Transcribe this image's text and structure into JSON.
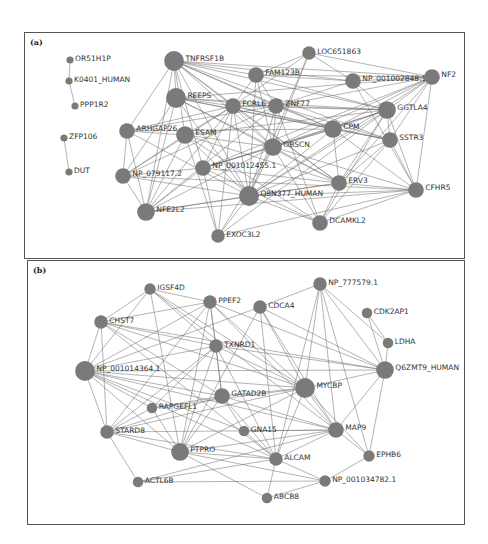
{
  "panels": [
    {
      "id": "a",
      "label": "(a)",
      "nodes": [
        {
          "name": "OR51H1P",
          "size": 1,
          "x": 70,
          "y": 60
        },
        {
          "name": "K0401_HUMAN",
          "size": 1,
          "x": 69,
          "y": 81
        },
        {
          "name": "PPP1R2",
          "size": 1,
          "x": 75,
          "y": 106
        },
        {
          "name": "ZFP106",
          "size": 1,
          "x": 64,
          "y": 138
        },
        {
          "name": "DUT",
          "size": 1,
          "x": 69,
          "y": 172
        },
        {
          "name": "TNFRSF1B",
          "size": 4,
          "x": 174,
          "y": 61
        },
        {
          "name": "REEPS",
          "size": 4,
          "x": 176,
          "y": 98
        },
        {
          "name": "ARHGAP26",
          "size": 3,
          "x": 127,
          "y": 131
        },
        {
          "name": "ESAM",
          "size": 3.5,
          "x": 185,
          "y": 135
        },
        {
          "name": "NP_079117.2",
          "size": 3,
          "x": 123,
          "y": 176
        },
        {
          "name": "NFE2L2",
          "size": 3.5,
          "x": 146,
          "y": 212
        },
        {
          "name": "EXOC3L2",
          "size": 2.5,
          "x": 218,
          "y": 236
        },
        {
          "name": "NP_001012455.1",
          "size": 3,
          "x": 203,
          "y": 168
        },
        {
          "name": "FAM123B",
          "size": 3,
          "x": 256,
          "y": 75
        },
        {
          "name": "FCRL6",
          "size": 3,
          "x": 233,
          "y": 106
        },
        {
          "name": "ZNF77",
          "size": 3,
          "x": 276,
          "y": 106
        },
        {
          "name": "OBSCN",
          "size": 3.5,
          "x": 273,
          "y": 147
        },
        {
          "name": "Q8N377_HUMAN",
          "size": 4,
          "x": 249,
          "y": 196
        },
        {
          "name": "LOC651863",
          "size": 2.5,
          "x": 309,
          "y": 53
        },
        {
          "name": "NP_001002848.1",
          "size": 3,
          "x": 353,
          "y": 81
        },
        {
          "name": "NF2",
          "size": 3,
          "x": 432,
          "y": 77
        },
        {
          "name": "CPM",
          "size": 3.5,
          "x": 333,
          "y": 129
        },
        {
          "name": "GGTLA4",
          "size": 3.5,
          "x": 387,
          "y": 110
        },
        {
          "name": "SSTR3",
          "size": 3,
          "x": 390,
          "y": 140
        },
        {
          "name": "ERV3",
          "size": 3,
          "x": 339,
          "y": 183
        },
        {
          "name": "CFHR5",
          "size": 3,
          "x": 416,
          "y": 190
        },
        {
          "name": "DCAMKL2",
          "size": 3,
          "x": 320,
          "y": 223
        }
      ],
      "edges": [
        [
          "OR51H1P",
          "K0401_HUMAN"
        ],
        [
          "K0401_HUMAN",
          "PPP1R2"
        ],
        [
          "ZFP106",
          "DUT"
        ],
        [
          "TNFRSF1B",
          "REEPS"
        ],
        [
          "TNFRSF1B",
          "FAM123B"
        ],
        [
          "TNFRSF1B",
          "FCRL6"
        ],
        [
          "TNFRSF1B",
          "ZNF77"
        ],
        [
          "TNFRSF1B",
          "OBSCN"
        ],
        [
          "TNFRSF1B",
          "CPM"
        ],
        [
          "TNFRSF1B",
          "GGTLA4"
        ],
        [
          "TNFRSF1B",
          "SSTR3"
        ],
        [
          "TNFRSF1B",
          "NP_001002848.1"
        ],
        [
          "TNFRSF1B",
          "Q8N377_HUMAN"
        ],
        [
          "TNFRSF1B",
          "ESAM"
        ],
        [
          "TNFRSF1B",
          "ARHGAP26"
        ],
        [
          "TNFRSF1B",
          "NP_001012455.1"
        ],
        [
          "TNFRSF1B",
          "ERV3"
        ],
        [
          "TNFRSF1B",
          "NF2"
        ],
        [
          "TNFRSF1B",
          "NFE2L2"
        ],
        [
          "REEPS",
          "FCRL6"
        ],
        [
          "REEPS",
          "ZNF77"
        ],
        [
          "REEPS",
          "CPM"
        ],
        [
          "REEPS",
          "GGTLA4"
        ],
        [
          "REEPS",
          "SSTR3"
        ],
        [
          "REEPS",
          "OBSCN"
        ],
        [
          "REEPS",
          "Q8N377_HUMAN"
        ],
        [
          "REEPS",
          "NP_079117.2"
        ],
        [
          "REEPS",
          "NFE2L2"
        ],
        [
          "REEPS",
          "ERV3"
        ],
        [
          "REEPS",
          "NF2"
        ],
        [
          "ARHGAP26",
          "ESAM"
        ],
        [
          "ARHGAP26",
          "NP_079117.2"
        ],
        [
          "ARHGAP26",
          "NFE2L2"
        ],
        [
          "ARHGAP26",
          "FCRL6"
        ],
        [
          "ARHGAP26",
          "ZNF77"
        ],
        [
          "ARHGAP26",
          "Q8N377_HUMAN"
        ],
        [
          "ARHGAP26",
          "CPM"
        ],
        [
          "ESAM",
          "FCRL6"
        ],
        [
          "ESAM",
          "OBSCN"
        ],
        [
          "ESAM",
          "Q8N377_HUMAN"
        ],
        [
          "ESAM",
          "NP_079117.2"
        ],
        [
          "ESAM",
          "NFE2L2"
        ],
        [
          "ESAM",
          "GGTLA4"
        ],
        [
          "ESAM",
          "EXOC3L2"
        ],
        [
          "ESAM",
          "ERV3"
        ],
        [
          "ESAM",
          "DCAMKL2"
        ],
        [
          "NP_079117.2",
          "NP_001012455.1"
        ],
        [
          "NP_079117.2",
          "Q8N377_HUMAN"
        ],
        [
          "NP_079117.2",
          "FCRL6"
        ],
        [
          "NP_079117.2",
          "ZNF77"
        ],
        [
          "NP_079117.2",
          "CFHR5"
        ],
        [
          "NP_079117.2",
          "NFE2L2"
        ],
        [
          "NFE2L2",
          "NP_001012455.1"
        ],
        [
          "NFE2L2",
          "Q8N377_HUMAN"
        ],
        [
          "NFE2L2",
          "ERV3"
        ],
        [
          "NFE2L2",
          "CFHR5"
        ],
        [
          "NFE2L2",
          "FCRL6"
        ],
        [
          "NFE2L2",
          "OBSCN"
        ],
        [
          "NFE2L2",
          "ZNF77"
        ],
        [
          "EXOC3L2",
          "NP_001012455.1"
        ],
        [
          "EXOC3L2",
          "Q8N377_HUMAN"
        ],
        [
          "EXOC3L2",
          "OBSCN"
        ],
        [
          "EXOC3L2",
          "FCRL6"
        ],
        [
          "EXOC3L2",
          "CFHR5"
        ],
        [
          "EXOC3L2",
          "GGTLA4"
        ],
        [
          "NP_001012455.1",
          "ERV3"
        ],
        [
          "NP_001012455.1",
          "OBSCN"
        ],
        [
          "NP_001012455.1",
          "GGTLA4"
        ],
        [
          "NP_001012455.1",
          "CPM"
        ],
        [
          "NP_001012455.1",
          "DCAMKL2"
        ],
        [
          "NP_001012455.1",
          "NF2"
        ],
        [
          "NP_001012455.1",
          "FCRL6"
        ],
        [
          "FAM123B",
          "FCRL6"
        ],
        [
          "FAM123B",
          "ZNF77"
        ],
        [
          "FAM123B",
          "NP_001002848.1"
        ],
        [
          "FAM123B",
          "OBSCN"
        ],
        [
          "FAM123B",
          "Q8N377_HUMAN"
        ],
        [
          "FAM123B",
          "NF2"
        ],
        [
          "FAM123B",
          "GGTLA4"
        ],
        [
          "FCRL6",
          "ZNF77"
        ],
        [
          "FCRL6",
          "OBSCN"
        ],
        [
          "FCRL6",
          "Q8N377_HUMAN"
        ],
        [
          "FCRL6",
          "CPM"
        ],
        [
          "FCRL6",
          "GGTLA4"
        ],
        [
          "FCRL6",
          "SSTR3"
        ],
        [
          "FCRL6",
          "ERV3"
        ],
        [
          "ZNF77",
          "OBSCN"
        ],
        [
          "ZNF77",
          "CPM"
        ],
        [
          "ZNF77",
          "GGTLA4"
        ],
        [
          "ZNF77",
          "NF2"
        ],
        [
          "ZNF77",
          "Q8N377_HUMAN"
        ],
        [
          "ZNF77",
          "SSTR3"
        ],
        [
          "ZNF77",
          "DCAMKL2"
        ],
        [
          "OBSCN",
          "CPM"
        ],
        [
          "OBSCN",
          "GGTLA4"
        ],
        [
          "OBSCN",
          "Q8N377_HUMAN"
        ],
        [
          "OBSCN",
          "ERV3"
        ],
        [
          "OBSCN",
          "CFHR5"
        ],
        [
          "OBSCN",
          "DCAMKL2"
        ],
        [
          "OBSCN",
          "NF2"
        ],
        [
          "Q8N377_HUMAN",
          "ERV3"
        ],
        [
          "Q8N377_HUMAN",
          "CFHR5"
        ],
        [
          "Q8N377_HUMAN",
          "DCAMKL2"
        ],
        [
          "Q8N377_HUMAN",
          "CPM"
        ],
        [
          "Q8N377_HUMAN",
          "GGTLA4"
        ],
        [
          "Q8N377_HUMAN",
          "SSTR3"
        ],
        [
          "Q8N377_HUMAN",
          "NF2"
        ],
        [
          "LOC651863",
          "NP_001002848.1"
        ],
        [
          "LOC651863",
          "NF2"
        ],
        [
          "LOC651863",
          "FAM123B"
        ],
        [
          "LOC651863",
          "OBSCN"
        ],
        [
          "LOC651863",
          "Q8N377_HUMAN"
        ],
        [
          "LOC651863",
          "FCRL6"
        ],
        [
          "NP_001002848.1",
          "NF2"
        ],
        [
          "NP_001002848.1",
          "GGTLA4"
        ],
        [
          "NP_001002848.1",
          "ZNF77"
        ],
        [
          "NP_001002848.1",
          "CFHR5"
        ],
        [
          "NF2",
          "GGTLA4"
        ],
        [
          "NF2",
          "CPM"
        ],
        [
          "NF2",
          "SSTR3"
        ],
        [
          "NF2",
          "CFHR5"
        ],
        [
          "NF2",
          "ERV3"
        ],
        [
          "CPM",
          "GGTLA4"
        ],
        [
          "CPM",
          "SSTR3"
        ],
        [
          "CPM",
          "ERV3"
        ],
        [
          "CPM",
          "CFHR5"
        ],
        [
          "GGTLA4",
          "SSTR3"
        ],
        [
          "GGTLA4",
          "ERV3"
        ],
        [
          "GGTLA4",
          "DCAMKL2"
        ],
        [
          "GGTLA4",
          "CFHR5"
        ],
        [
          "SSTR3",
          "CFHR5"
        ],
        [
          "SSTR3",
          "ERV3"
        ],
        [
          "SSTR3",
          "DCAMKL2"
        ],
        [
          "ERV3",
          "CFHR5"
        ],
        [
          "ERV3",
          "DCAMKL2"
        ],
        [
          "CFHR5",
          "DCAMKL2"
        ]
      ]
    },
    {
      "id": "b",
      "label": "(b)",
      "nodes": [
        {
          "name": "IGSF4D",
          "size": 2,
          "x": 150,
          "y": 289
        },
        {
          "name": "PPEF2",
          "size": 2.5,
          "x": 210,
          "y": 302
        },
        {
          "name": "CHST7",
          "size": 2.5,
          "x": 101,
          "y": 322
        },
        {
          "name": "CDCA4",
          "size": 2.5,
          "x": 260,
          "y": 307
        },
        {
          "name": "NP_777579.1",
          "size": 2.5,
          "x": 320,
          "y": 284
        },
        {
          "name": "CDK2AP1",
          "size": 1.8,
          "x": 367,
          "y": 313
        },
        {
          "name": "LDHA",
          "size": 1.8,
          "x": 388,
          "y": 343
        },
        {
          "name": "TXNRD1",
          "size": 2.5,
          "x": 216,
          "y": 346
        },
        {
          "name": "NP_001014364.1",
          "size": 4,
          "x": 85,
          "y": 371
        },
        {
          "name": "Q6ZMT9_HUMAN",
          "size": 3.5,
          "x": 385,
          "y": 370
        },
        {
          "name": "MYCBP",
          "size": 4,
          "x": 305,
          "y": 388
        },
        {
          "name": "GATAD2B",
          "size": 3,
          "x": 222,
          "y": 396
        },
        {
          "name": "RAPGEFL1",
          "size": 1.8,
          "x": 152,
          "y": 408
        },
        {
          "name": "STARD8",
          "size": 2.5,
          "x": 107,
          "y": 432
        },
        {
          "name": "GNA15",
          "size": 1.8,
          "x": 244,
          "y": 431
        },
        {
          "name": "MAP9",
          "size": 3,
          "x": 336,
          "y": 430
        },
        {
          "name": "PTPRO",
          "size": 3.5,
          "x": 180,
          "y": 452
        },
        {
          "name": "ALCAM",
          "size": 2.5,
          "x": 276,
          "y": 459
        },
        {
          "name": "EPHB6",
          "size": 2,
          "x": 369,
          "y": 456
        },
        {
          "name": "ACTL6B",
          "size": 1.8,
          "x": 138,
          "y": 482
        },
        {
          "name": "NP_001034782.1",
          "size": 2,
          "x": 325,
          "y": 481
        },
        {
          "name": "ABCB8",
          "size": 1.8,
          "x": 267,
          "y": 498
        }
      ],
      "edges": [
        [
          "IGSF4D",
          "PPEF2"
        ],
        [
          "IGSF4D",
          "CHST7"
        ],
        [
          "IGSF4D",
          "TXNRD1"
        ],
        [
          "IGSF4D",
          "MYCBP"
        ],
        [
          "IGSF4D",
          "PTPRO"
        ],
        [
          "IGSF4D",
          "MAP9"
        ],
        [
          "IGSF4D",
          "NP_001014364.1"
        ],
        [
          "PPEF2",
          "CHST7"
        ],
        [
          "PPEF2",
          "TXNRD1"
        ],
        [
          "PPEF2",
          "NP_001014364.1"
        ],
        [
          "PPEF2",
          "MYCBP"
        ],
        [
          "PPEF2",
          "PTPRO"
        ],
        [
          "PPEF2",
          "STARD8"
        ],
        [
          "PPEF2",
          "Q6ZMT9_HUMAN"
        ],
        [
          "PPEF2",
          "GATAD2B"
        ],
        [
          "PPEF2",
          "MAP9"
        ],
        [
          "CHST7",
          "NP_001014364.1"
        ],
        [
          "CHST7",
          "TXNRD1"
        ],
        [
          "CHST7",
          "MYCBP"
        ],
        [
          "CHST7",
          "GATAD2B"
        ],
        [
          "CHST7",
          "STARD8"
        ],
        [
          "CHST7",
          "ALCAM"
        ],
        [
          "CHST7",
          "Q6ZMT9_HUMAN"
        ],
        [
          "CDCA4",
          "NP_777579.1"
        ],
        [
          "CDCA4",
          "MYCBP"
        ],
        [
          "CDCA4",
          "MAP9"
        ],
        [
          "CDCA4",
          "Q6ZMT9_HUMAN"
        ],
        [
          "CDCA4",
          "NP_001014364.1"
        ],
        [
          "CDCA4",
          "ALCAM"
        ],
        [
          "CDCA4",
          "PTPRO"
        ],
        [
          "NP_777579.1",
          "MYCBP"
        ],
        [
          "NP_777579.1",
          "MAP9"
        ],
        [
          "NP_777579.1",
          "Q6ZMT9_HUMAN"
        ],
        [
          "NP_777579.1",
          "LDHA"
        ],
        [
          "NP_777579.1",
          "EPHB6"
        ],
        [
          "NP_777579.1",
          "ALCAM"
        ],
        [
          "CDK2AP1",
          "LDHA"
        ],
        [
          "CDK2AP1",
          "Q6ZMT9_HUMAN"
        ],
        [
          "LDHA",
          "Q6ZMT9_HUMAN"
        ],
        [
          "TXNRD1",
          "NP_001014364.1"
        ],
        [
          "TXNRD1",
          "GATAD2B"
        ],
        [
          "TXNRD1",
          "MYCBP"
        ],
        [
          "TXNRD1",
          "PTPRO"
        ],
        [
          "TXNRD1",
          "STARD8"
        ],
        [
          "TXNRD1",
          "Q6ZMT9_HUMAN"
        ],
        [
          "TXNRD1",
          "RAPGEFL1"
        ],
        [
          "TXNRD1",
          "ALCAM"
        ],
        [
          "NP_001014364.1",
          "MYCBP"
        ],
        [
          "NP_001014364.1",
          "GATAD2B"
        ],
        [
          "NP_001014364.1",
          "STARD8"
        ],
        [
          "NP_001014364.1",
          "PTPRO"
        ],
        [
          "NP_001014364.1",
          "MAP9"
        ],
        [
          "NP_001014364.1",
          "Q6ZMT9_HUMAN"
        ],
        [
          "NP_001014364.1",
          "ALCAM"
        ],
        [
          "NP_001014364.1",
          "RAPGEFL1"
        ],
        [
          "NP_001014364.1",
          "GNA15"
        ],
        [
          "Q6ZMT9_HUMAN",
          "MYCBP"
        ],
        [
          "Q6ZMT9_HUMAN",
          "EPHB6"
        ],
        [
          "Q6ZMT9_HUMAN",
          "MAP9"
        ],
        [
          "MYCBP",
          "GATAD2B"
        ],
        [
          "MYCBP",
          "MAP9"
        ],
        [
          "MYCBP",
          "PTPRO"
        ],
        [
          "MYCBP",
          "ALCAM"
        ],
        [
          "MYCBP",
          "EPHB6"
        ],
        [
          "MYCBP",
          "STARD8"
        ],
        [
          "MYCBP",
          "RAPGEFL1"
        ],
        [
          "GATAD2B",
          "PTPRO"
        ],
        [
          "GATAD2B",
          "STARD8"
        ],
        [
          "GATAD2B",
          "MAP9"
        ],
        [
          "GATAD2B",
          "GNA15"
        ],
        [
          "GATAD2B",
          "RAPGEFL1"
        ],
        [
          "GATAD2B",
          "ALCAM"
        ],
        [
          "RAPGEFL1",
          "PTPRO"
        ],
        [
          "RAPGEFL1",
          "STARD8"
        ],
        [
          "STARD8",
          "PTPRO"
        ],
        [
          "STARD8",
          "ACTL6B"
        ],
        [
          "STARD8",
          "MAP9"
        ],
        [
          "STARD8",
          "ALCAM"
        ],
        [
          "GNA15",
          "MAP9"
        ],
        [
          "GNA15",
          "ALCAM"
        ],
        [
          "MAP9",
          "PTPRO"
        ],
        [
          "MAP9",
          "EPHB6"
        ],
        [
          "MAP9",
          "ALCAM"
        ],
        [
          "PTPRO",
          "ALCAM"
        ],
        [
          "PTPRO",
          "ABCB8"
        ],
        [
          "PTPRO",
          "NP_001034782.1"
        ],
        [
          "ALCAM",
          "NP_001034782.1"
        ],
        [
          "ALCAM",
          "ABCB8"
        ],
        [
          "EPHB6",
          "NP_001034782.1"
        ],
        [
          "ACTL6B",
          "MAP9"
        ],
        [
          "ACTL6B",
          "ALCAM"
        ],
        [
          "ACTL6B",
          "NP_001034782.1"
        ],
        [
          "NP_001034782.1",
          "ABCB8"
        ]
      ]
    }
  ]
}
